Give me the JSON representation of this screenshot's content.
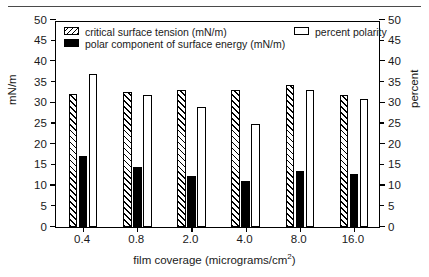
{
  "chart_data": {
    "type": "bar",
    "title": "",
    "xlabel": "film coverage (micrograms/cm2)",
    "xlabel_main": "film coverage (micrograms/cm",
    "xlabel_sup": "2",
    "xlabel_tail": ")",
    "ylabel_left": "mN/m",
    "ylabel_right": "percent",
    "categories": [
      "0.4",
      "0.8",
      "2.0",
      "4.0",
      "8.0",
      "16.0"
    ],
    "ylim": [
      0,
      50
    ],
    "ylim_right": [
      0,
      50
    ],
    "ytick_labels": [
      "0",
      "5",
      "10",
      "15",
      "20",
      "25",
      "30",
      "35",
      "40",
      "45",
      "50"
    ],
    "ytick_values": [
      0,
      5,
      10,
      15,
      20,
      25,
      30,
      35,
      40,
      45,
      50
    ],
    "ytick_labels_right": [
      "0",
      "5",
      "10",
      "15",
      "20",
      "25",
      "30",
      "35",
      "40",
      "45",
      "50"
    ],
    "grid": false,
    "legend_position": "upper-center",
    "series": [
      {
        "name": "critical surface tension (mN/m)",
        "axis": "left",
        "style": "hatched",
        "values": [
          32.2,
          32.7,
          33.0,
          33.2,
          34.3,
          31.8
        ]
      },
      {
        "name": "polar component of surface energy (mN/m)",
        "axis": "left",
        "style": "solid-black",
        "values": [
          17.2,
          14.5,
          12.4,
          11.0,
          13.5,
          12.8
        ]
      },
      {
        "name": "percent polarity",
        "axis": "right",
        "style": "open-white",
        "values": [
          37,
          32,
          29,
          25,
          33,
          31
        ]
      }
    ]
  },
  "legend": {
    "items": [
      {
        "label": "critical surface tension (mN/m)",
        "swatch": "hatched-swatch-icon"
      },
      {
        "label": "polar component of surface energy (mN/m)",
        "swatch": "black-swatch-icon"
      },
      {
        "label": "percent polarity",
        "swatch": "white-swatch-icon"
      }
    ]
  }
}
